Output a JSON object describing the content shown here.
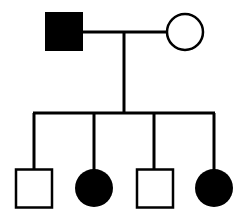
{
  "diagram": {
    "type": "pedigree-chart",
    "colors": {
      "line": "#000000",
      "affected_fill": "#000000",
      "unaffected_fill": "#ffffff"
    },
    "generation_1": {
      "father": {
        "shape": "square",
        "sex": "male",
        "affected": true
      },
      "mother": {
        "shape": "circle",
        "sex": "female",
        "affected": false
      }
    },
    "generation_2": [
      {
        "shape": "square",
        "sex": "male",
        "affected": false
      },
      {
        "shape": "circle",
        "sex": "female",
        "affected": true
      },
      {
        "shape": "square",
        "sex": "male",
        "affected": false
      },
      {
        "shape": "circle",
        "sex": "female",
        "affected": true
      }
    ]
  }
}
